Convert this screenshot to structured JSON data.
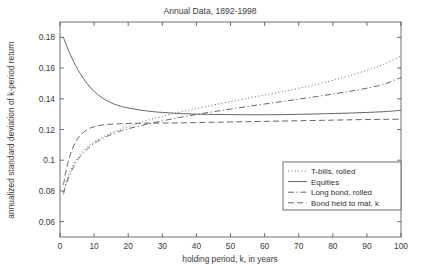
{
  "chart_data": {
    "type": "line",
    "title": "Annual Data, 1892-1998",
    "xlabel": "holding period, k, in years",
    "ylabel": "annualized standard deviation of k-period return",
    "xlim": [
      0,
      100
    ],
    "ylim": [
      0.05,
      0.19
    ],
    "grid": false,
    "legend_position": "lower right",
    "xticks": [
      0,
      10,
      20,
      30,
      40,
      50,
      60,
      70,
      80,
      90,
      100
    ],
    "xtick_labels": [
      "0",
      "10",
      "20",
      "30",
      "40",
      "50",
      "60",
      "70",
      "80",
      "90",
      "100"
    ],
    "yticks": [
      0.06,
      0.08,
      0.1,
      0.12,
      0.14,
      0.16,
      0.18
    ],
    "ytick_labels": [
      "0.06",
      "0.08",
      "0.1",
      "0.12",
      "0.14",
      "0.16",
      "0.18"
    ],
    "series": [
      {
        "name": "T-bills, rolled",
        "style": "dotted",
        "color": "#555555",
        "x": [
          1,
          2,
          3,
          4,
          5,
          6,
          8,
          10,
          12,
          15,
          18,
          20,
          25,
          30,
          35,
          40,
          45,
          50,
          55,
          60,
          65,
          70,
          75,
          80,
          85,
          90,
          95,
          100
        ],
        "y": [
          0.0795,
          0.0872,
          0.093,
          0.0975,
          0.101,
          0.104,
          0.1085,
          0.1118,
          0.1145,
          0.1178,
          0.1205,
          0.122,
          0.1255,
          0.1285,
          0.1312,
          0.1337,
          0.136,
          0.1382,
          0.1403,
          0.1424,
          0.1445,
          0.1468,
          0.1492,
          0.152,
          0.1551,
          0.1585,
          0.1625,
          0.1678
        ]
      },
      {
        "name": "Equities",
        "style": "solid",
        "color": "#555555",
        "x": [
          1,
          2,
          3,
          4,
          5,
          6,
          8,
          10,
          12,
          15,
          18,
          20,
          25,
          30,
          35,
          40,
          45,
          50,
          55,
          60,
          65,
          70,
          75,
          80,
          85,
          90,
          95,
          100
        ],
        "y": [
          0.18,
          0.1742,
          0.169,
          0.1642,
          0.16,
          0.1562,
          0.1498,
          0.1448,
          0.1412,
          0.1374,
          0.135,
          0.134,
          0.1322,
          0.1311,
          0.1304,
          0.13,
          0.1298,
          0.1297,
          0.1296,
          0.1296,
          0.1297,
          0.1299,
          0.1301,
          0.1304,
          0.1307,
          0.1311,
          0.1316,
          0.1325
        ]
      },
      {
        "name": "Long bond, rolled",
        "style": "dashdot",
        "color": "#555555",
        "x": [
          1,
          2,
          3,
          4,
          5,
          6,
          8,
          10,
          12,
          15,
          18,
          20,
          25,
          30,
          35,
          40,
          45,
          50,
          55,
          60,
          65,
          70,
          75,
          80,
          85,
          90,
          95,
          100
        ],
        "y": [
          0.0778,
          0.0855,
          0.0912,
          0.0958,
          0.0995,
          0.1025,
          0.1072,
          0.1108,
          0.1135,
          0.1168,
          0.1192,
          0.1205,
          0.1232,
          0.1256,
          0.1278,
          0.1298,
          0.1316,
          0.1333,
          0.135,
          0.1366,
          0.1382,
          0.1398,
          0.1414,
          0.1431,
          0.1449,
          0.1469,
          0.1495,
          0.1538
        ]
      },
      {
        "name": "Bond held to mat. k",
        "style": "dashed",
        "color": "#555555",
        "x": [
          1,
          2,
          3,
          4,
          5,
          6,
          8,
          10,
          12,
          15,
          18,
          20,
          25,
          30,
          35,
          40,
          45,
          50,
          55,
          60,
          65,
          70,
          75,
          80,
          85,
          90,
          95,
          100
        ],
        "y": [
          0.084,
          0.0955,
          0.1035,
          0.1092,
          0.1133,
          0.1163,
          0.12,
          0.1218,
          0.1228,
          0.1235,
          0.1238,
          0.1239,
          0.1241,
          0.1242,
          0.1243,
          0.1245,
          0.1247,
          0.1249,
          0.1251,
          0.1253,
          0.1255,
          0.1257,
          0.1259,
          0.1261,
          0.1263,
          0.1265,
          0.1266,
          0.1267
        ]
      }
    ]
  }
}
